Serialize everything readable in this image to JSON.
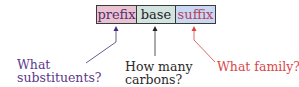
{
  "boxes": [
    {
      "label": "prefix",
      "bg": "#e9c3d2",
      "color": "#5a2d6e"
    },
    {
      "label": "base",
      "bg": "#d3e3e0",
      "color": "#222222"
    },
    {
      "label": "suffix",
      "bg": "#c8d8f3",
      "color": "#b5405e"
    }
  ],
  "annotations": {
    "prefix": {
      "line1": "What",
      "line2": "substituents?",
      "color": "#5b3a8a"
    },
    "base": {
      "line1": "How many",
      "line2": "carbons?",
      "color": "#2a2a2a"
    },
    "suffix": {
      "line1": "What family?",
      "color": "#d84848"
    }
  }
}
